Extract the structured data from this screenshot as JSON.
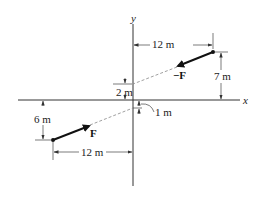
{
  "diagram": {
    "axes": {
      "x_label": "x",
      "y_label": "y"
    },
    "forces": [
      {
        "name": "F",
        "label": "F",
        "position": "lower-left"
      },
      {
        "name": "-F",
        "label": "−F",
        "position": "upper-right"
      }
    ],
    "dimensions": {
      "top_horizontal": "12 m",
      "top_vertical": "7 m",
      "upper_intercept": "2 m",
      "lower_intercept": "1 m",
      "bottom_vertical": "6 m",
      "bottom_horizontal": "12 m"
    },
    "colors": {
      "line": "#222222",
      "dashed": "#888888",
      "background": "#ffffff"
    }
  }
}
